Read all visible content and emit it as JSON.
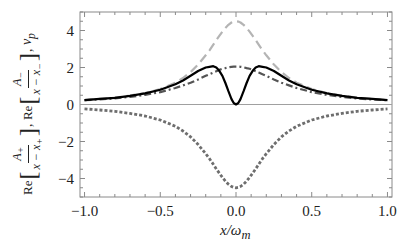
{
  "chart_data": {
    "type": "line",
    "title": "",
    "xlabel": "x/ω_m",
    "ylabel": "Re[A₊/(x − x₊)], Re[A₋/(x − x₋)], v_p",
    "xlim": [
      -1.03,
      1.03
    ],
    "ylim": [
      -5.0,
      5.0
    ],
    "x_ticks": [
      -1.0,
      -0.5,
      0.0,
      0.5,
      1.0
    ],
    "x_tick_labels": [
      "−1.0",
      "−0.5",
      "0.0",
      "0.5",
      "1.0"
    ],
    "y_ticks": [
      -4,
      -2,
      0,
      2,
      4
    ],
    "y_tick_labels": [
      "−4",
      "−2",
      "0",
      "2",
      "4"
    ],
    "grid": false,
    "legend": null,
    "zero_line": true,
    "x": [
      -1.0,
      -0.9,
      -0.8,
      -0.7,
      -0.6,
      -0.5,
      -0.4,
      -0.35,
      -0.3,
      -0.25,
      -0.2,
      -0.175,
      -0.15,
      -0.13,
      -0.11,
      -0.09,
      -0.07,
      -0.05,
      -0.03,
      -0.015,
      0.0,
      0.015,
      0.03,
      0.05,
      0.07,
      0.09,
      0.11,
      0.13,
      0.15,
      0.175,
      0.2,
      0.25,
      0.3,
      0.35,
      0.4,
      0.5,
      0.6,
      0.7,
      0.8,
      0.9,
      1.0
    ],
    "series": [
      {
        "name": "Re[A₋/(x − x₋)] (light gray dashed)",
        "style": "dashed",
        "color": "#b4b4b4",
        "values": [
          0.24,
          0.3,
          0.37,
          0.48,
          0.62,
          0.84,
          1.18,
          1.43,
          1.75,
          2.16,
          2.66,
          2.93,
          3.23,
          3.48,
          3.71,
          3.94,
          4.14,
          4.31,
          4.43,
          4.48,
          4.5,
          4.48,
          4.43,
          4.31,
          4.14,
          3.94,
          3.71,
          3.48,
          3.23,
          2.93,
          2.66,
          2.16,
          1.75,
          1.43,
          1.18,
          0.84,
          0.62,
          0.48,
          0.37,
          0.3,
          0.24
        ]
      },
      {
        "name": "Re[A₊/(x − x₊)] (dark gray dotted)",
        "style": "dotted",
        "color": "#6e6e6e",
        "values": [
          -0.24,
          -0.3,
          -0.37,
          -0.48,
          -0.62,
          -0.84,
          -1.18,
          -1.43,
          -1.75,
          -2.16,
          -2.66,
          -2.93,
          -3.23,
          -3.48,
          -3.71,
          -3.94,
          -4.14,
          -4.31,
          -4.43,
          -4.48,
          -4.5,
          -4.48,
          -4.43,
          -4.31,
          -4.14,
          -3.94,
          -3.71,
          -3.48,
          -3.23,
          -2.93,
          -2.66,
          -2.16,
          -1.75,
          -1.43,
          -1.18,
          -0.84,
          -0.62,
          -0.48,
          -0.37,
          -0.3,
          -0.24
        ]
      },
      {
        "name": "dash-dot (dark gray)",
        "style": "dashdot",
        "color": "#555555",
        "values": [
          0.23,
          0.27,
          0.33,
          0.41,
          0.52,
          0.67,
          0.89,
          1.03,
          1.18,
          1.35,
          1.55,
          1.64,
          1.73,
          1.8,
          1.87,
          1.93,
          1.97,
          2.01,
          2.04,
          2.05,
          2.05,
          2.05,
          2.04,
          2.01,
          1.97,
          1.93,
          1.87,
          1.8,
          1.73,
          1.64,
          1.55,
          1.35,
          1.18,
          1.03,
          0.89,
          0.67,
          0.52,
          0.41,
          0.33,
          0.27,
          0.23
        ]
      },
      {
        "name": "v_p (black solid)",
        "style": "solid",
        "color": "#000000",
        "values": [
          0.24,
          0.3,
          0.36,
          0.47,
          0.6,
          0.8,
          1.1,
          1.3,
          1.55,
          1.81,
          2.0,
          2.04,
          2.07,
          2.0,
          1.82,
          1.55,
          1.16,
          0.72,
          0.29,
          0.08,
          0.0,
          0.08,
          0.29,
          0.72,
          1.16,
          1.55,
          1.82,
          2.0,
          2.07,
          2.04,
          2.0,
          1.81,
          1.55,
          1.3,
          1.1,
          0.8,
          0.6,
          0.47,
          0.36,
          0.3,
          0.24
        ]
      }
    ]
  },
  "axes": {
    "xlabel_main": "x/ω",
    "xlabel_sub": "m",
    "y_re": "Re",
    "y_A_plus": "A",
    "y_plus_sub": "+",
    "y_A_minus": "A",
    "y_minus_sub": "−",
    "y_den_plus": "x − x",
    "y_den_minus": "x − x",
    "y_vp": "v",
    "y_vp_sub": "p",
    "comma": ","
  }
}
